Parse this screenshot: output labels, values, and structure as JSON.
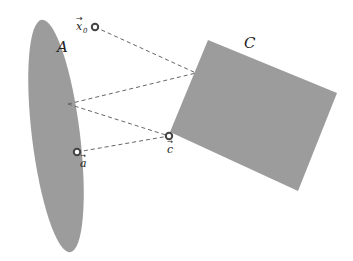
{
  "diagram": {
    "title": "",
    "colors": {
      "shape_fill": "#9c9c9c",
      "line": "#666666",
      "point_stroke": "#444444",
      "background": "#ffffff"
    },
    "shapes": [
      {
        "id": "A",
        "type": "ellipse",
        "label": "A",
        "cx": 56,
        "cy": 136,
        "rx": 24,
        "ry": 117,
        "rotate": -7,
        "label_pos": [
          57,
          51
        ]
      },
      {
        "id": "C",
        "type": "rectangle",
        "label": "C",
        "points": [
          [
            208,
            40
          ],
          [
            337,
            93
          ],
          [
            298,
            191
          ],
          [
            170,
            132
          ]
        ],
        "label_pos": [
          244,
          47
        ]
      }
    ],
    "points": [
      {
        "id": "x0",
        "label": "x",
        "subscript": "0",
        "x": 95,
        "y": 27,
        "label_pos": [
          76,
          28
        ]
      },
      {
        "id": "a",
        "label": "a",
        "x": 77,
        "y": 152,
        "label_pos": [
          79,
          166
        ]
      },
      {
        "id": "c",
        "label": "c",
        "x": 169,
        "y": 136,
        "label_pos": [
          167,
          152
        ]
      }
    ],
    "dashed_lines": [
      {
        "from": [
          95,
          27
        ],
        "to": [
          196,
          73
        ]
      },
      {
        "from": [
          68,
          104
        ],
        "to": [
          196,
          73
        ]
      },
      {
        "from": [
          68,
          104
        ],
        "to": [
          169,
          136
        ]
      },
      {
        "from": [
          77,
          152
        ],
        "to": [
          169,
          136
        ]
      }
    ]
  }
}
